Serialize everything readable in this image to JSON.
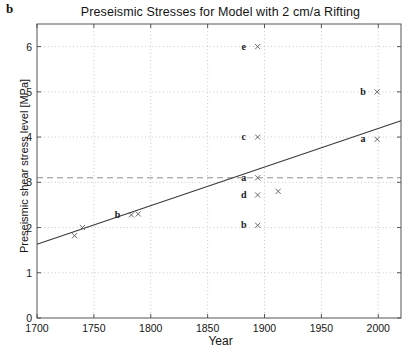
{
  "panel": {
    "label": "b"
  },
  "chart_data": {
    "type": "scatter",
    "title": "Preseismic Stresses for Model with 2 cm/a Rifting",
    "xlabel": "Year",
    "ylabel": "Preseismic shear stress level [MPa]",
    "xlim": [
      1700,
      2020
    ],
    "ylim": [
      0,
      6.5
    ],
    "xticks": [
      1700,
      1750,
      1800,
      1850,
      1900,
      1950,
      2000
    ],
    "yticks": [
      0,
      1,
      2,
      3,
      4,
      5,
      6
    ],
    "grid": "dotted",
    "legend": "none",
    "points": [
      {
        "x": 1733,
        "y": 1.82,
        "label": "",
        "marker": "x"
      },
      {
        "x": 1740,
        "y": 2.0,
        "label": "",
        "marker": "x"
      },
      {
        "x": 1783,
        "y": 2.28,
        "label": "b",
        "marker": "x"
      },
      {
        "x": 1789,
        "y": 2.3,
        "label": "",
        "marker": "x"
      },
      {
        "x": 1894,
        "y": 6.0,
        "label": "e",
        "marker": "x"
      },
      {
        "x": 1894,
        "y": 4.0,
        "label": "c",
        "marker": "x"
      },
      {
        "x": 1894,
        "y": 3.1,
        "label": "a",
        "marker": "x"
      },
      {
        "x": 1894,
        "y": 2.72,
        "label": "d",
        "marker": "x"
      },
      {
        "x": 1894,
        "y": 2.05,
        "label": "b",
        "marker": "x"
      },
      {
        "x": 1912,
        "y": 2.8,
        "label": "",
        "marker": "x"
      },
      {
        "x": 1999,
        "y": 5.0,
        "label": "b",
        "marker": "x"
      },
      {
        "x": 1999,
        "y": 3.95,
        "label": "a",
        "marker": "x"
      }
    ],
    "trend_line": {
      "style": "solid",
      "x": [
        1700,
        2020
      ],
      "y": [
        1.63,
        4.36
      ]
    },
    "threshold_line": {
      "style": "dashed",
      "value": 3.1
    }
  }
}
